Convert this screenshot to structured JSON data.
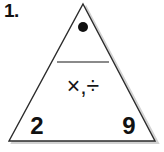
{
  "item": {
    "number_label": "1.",
    "figure_type": "fact-family-triangle"
  },
  "triangle": {
    "apex_marker": "●",
    "apex_marker_name": "filled-dot",
    "divider_name": "horizontal-rule",
    "operators": "×,÷",
    "bottom_left_value": "2",
    "bottom_right_value": "9"
  },
  "colors": {
    "background": "#ffffff",
    "outline": "#2b2b2b",
    "shadow": "#cfcfcf",
    "divider": "#8a8a8a",
    "text": "#111111"
  }
}
